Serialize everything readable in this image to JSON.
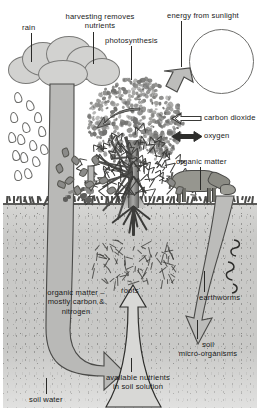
{
  "diagram": {
    "canvas": {
      "width": 260,
      "height": 419
    },
    "palette": {
      "soil": "#c9c9c7",
      "arrow_fill": "#b9b9b7",
      "arrow_stroke": "#4a4a48",
      "ink": "#1a1a1a",
      "leaf": "#6f6f6d",
      "background": "#ffffff"
    },
    "labels": {
      "rain": "rain",
      "harvesting": "harvesting removes\nnutrients",
      "photosynthesis": "photosynthesis",
      "sunlight": "energy from sunlight",
      "carbon_dioxide": "carbon dioxide",
      "oxygen": "oxygen",
      "organic_matter_surface": "organic matter",
      "organic_matter_soil": "organic matter –\nmostly carbon &\nnitrogen",
      "roots": "roots",
      "earthworms": "earthworms",
      "soil_micro_organisms": "soil\nmicro-organisms",
      "available_nutrients": "available nutrients\nin soil solution",
      "soil_water": "soil water"
    },
    "elements": {
      "sun": "sun-circle",
      "cloud": "rain-cloud",
      "tree": "tree",
      "cow": "grazing-cow",
      "manure": "manure-heap",
      "worms": "earthworm-squiggles"
    },
    "flows": [
      {
        "name": "sunlight-to-tree",
        "direction": "down-left"
      },
      {
        "name": "rain-to-soil",
        "direction": "down"
      },
      {
        "name": "carbon-dioxide-uptake",
        "direction": "left"
      },
      {
        "name": "oxygen-exchange",
        "direction": "both"
      },
      {
        "name": "harvest-removal",
        "direction": "left"
      },
      {
        "name": "litter-to-soil",
        "direction": "down"
      },
      {
        "name": "organic-matter-into-soil",
        "direction": "down"
      },
      {
        "name": "earthworm-mixing",
        "direction": "down"
      },
      {
        "name": "nutrient-uptake-by-roots",
        "direction": "up"
      },
      {
        "name": "soil-water-movement",
        "direction": "down-right"
      }
    ]
  }
}
